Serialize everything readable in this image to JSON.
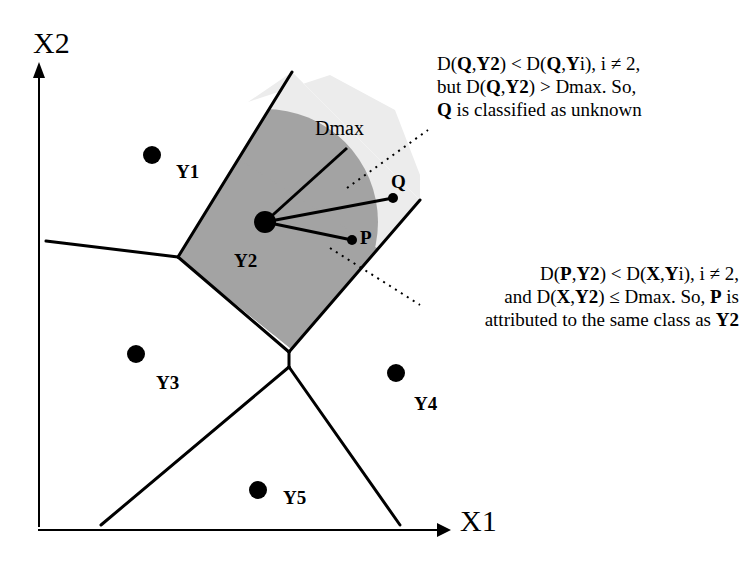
{
  "axes": {
    "x_label": "X1",
    "y_label": "X2"
  },
  "points": [
    {
      "id": "Y1",
      "label": "Y1",
      "x": 152,
      "y": 155
    },
    {
      "id": "Y2",
      "label": "Y2",
      "x": 265,
      "y": 222
    },
    {
      "id": "Y3",
      "label": "Y3",
      "x": 136,
      "y": 354
    },
    {
      "id": "Y4",
      "label": "Y4",
      "x": 396,
      "y": 373
    },
    {
      "id": "Y5",
      "label": "Y5",
      "x": 258,
      "y": 490
    }
  ],
  "query_points": [
    {
      "id": "Q",
      "label": "Q"
    },
    {
      "id": "P",
      "label": "P"
    }
  ],
  "dmax_label": "Dmax",
  "annotations": {
    "q_note": {
      "line1_parts": [
        "D(",
        "Q",
        ",",
        "Y2",
        ") < D(",
        "Q",
        ",",
        "Y",
        "i), i ≠ 2,"
      ],
      "line2_parts": [
        "but D(",
        "Q",
        ",",
        "Y2",
        ") > Dmax. So,"
      ],
      "line3_parts": [
        "Q",
        " is classified as unknown"
      ]
    },
    "p_note": {
      "line1_parts": [
        "D(",
        "P",
        ",",
        "Y2",
        ") < D(",
        "X",
        ",",
        "Y",
        "i), i ≠ 2,"
      ],
      "line2_parts": [
        "and D(",
        "X",
        ",",
        "Y2",
        ") ≤ Dmax. So, ",
        "P",
        " is"
      ],
      "line3_parts": [
        "attributed to the same class as ",
        "Y2"
      ]
    }
  },
  "colors": {
    "cell_fill": "#a8a8a8",
    "dmax_fill": "#9a9a9a",
    "outer_fill": "#e8e8e8",
    "line": "#000000"
  }
}
